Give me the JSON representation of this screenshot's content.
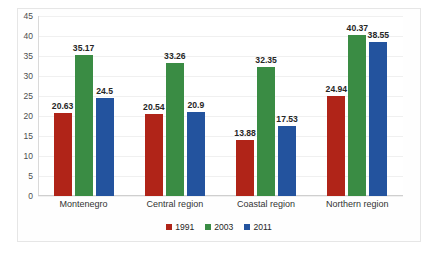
{
  "chart_data": {
    "type": "bar",
    "title": "",
    "subtitle": "",
    "xlabel": "",
    "ylabel": "",
    "categories": [
      "Montenegro",
      "Central region",
      "Coastal region",
      "Northern region"
    ],
    "series": [
      {
        "name": "1991",
        "color": "#b02418",
        "values": [
          20.63,
          20.54,
          13.88,
          24.94
        ]
      },
      {
        "name": "2003",
        "color": "#3a8c44",
        "values": [
          35.17,
          33.26,
          32.35,
          40.37
        ]
      },
      {
        "name": "2011",
        "color": "#23539e",
        "values": [
          24.5,
          20.9,
          17.53,
          38.55
        ]
      }
    ],
    "data_labels": [
      [
        "20.63",
        "35.17",
        "24.5"
      ],
      [
        "20.54",
        "33.26",
        "20.9"
      ],
      [
        "13.88",
        "32.35",
        "17.53"
      ],
      [
        "24.94",
        "40.37",
        "38.55"
      ]
    ],
    "yticks": [
      45,
      40,
      35,
      30,
      25,
      20,
      15,
      10,
      5,
      0
    ],
    "ytick_labels": [
      "45",
      "40",
      "35",
      "30",
      "25",
      "20",
      "15",
      "10",
      "5",
      "0"
    ],
    "ylim": [
      0,
      45
    ],
    "grid": true,
    "legend_position": "bottom",
    "legend": [
      "1991",
      "2003",
      "2011"
    ]
  }
}
